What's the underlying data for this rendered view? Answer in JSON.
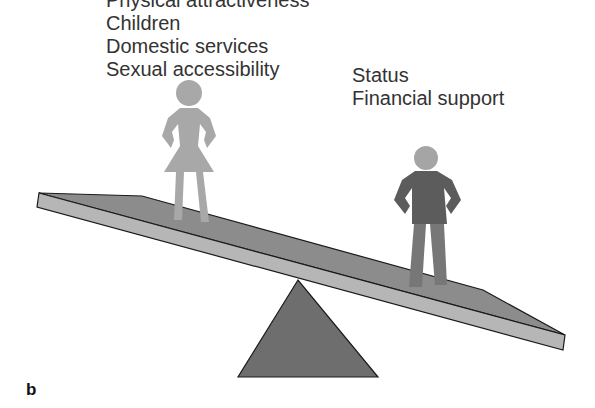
{
  "figure": {
    "panel_label": "b",
    "woman_side": {
      "figure": "woman-figure",
      "labels": [
        "Physical attractiveness",
        "Children",
        "Domestic services",
        "Sexual accessibility"
      ]
    },
    "man_side": {
      "figure": "man-figure",
      "labels": [
        "Status",
        "Financial support"
      ]
    },
    "scale": {
      "type": "seesaw",
      "tilt": "right-side-down",
      "colors": {
        "beam_top": "#8a8a8a",
        "beam_front": "#b4b4b4",
        "fulcrum": "#6e6e6e",
        "woman": "#a8a8a8",
        "man_suit": "#5c5c5c",
        "man_legs": "#777777",
        "man_head": "#a5a5a5",
        "outline": "#1a1a1a"
      }
    }
  }
}
